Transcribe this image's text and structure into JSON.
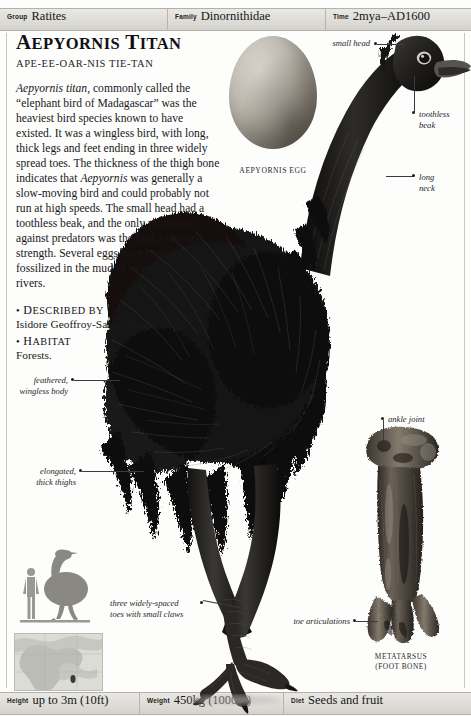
{
  "header": {
    "fields": [
      {
        "label": "Group",
        "value": "Ratites"
      },
      {
        "label": "Family",
        "value": "Dinornithidae"
      },
      {
        "label": "Time",
        "value": "2mya–AD1600"
      }
    ]
  },
  "footer": {
    "fields": [
      {
        "label": "Height",
        "value": "up to 3m (10ft)"
      },
      {
        "label": "Weight",
        "value": "450kg (1000lb)"
      },
      {
        "label": "Diet",
        "value": "Seeds and fruit"
      }
    ]
  },
  "article": {
    "title_first": "A",
    "title_rest": "EPYORNIS",
    "title_second_first": "T",
    "title_second_rest": "ITAN",
    "pronunciation": "APE-EE-OAR-NIS TIE-TAN",
    "paragraph_lead_italic": "Aepyornis titan",
    "paragraph_part1": ", commonly called the “elephant bird of Madagascar” was the heaviest bird species known to have existed. It was a wingless bird, with long, thick legs and feet ending in three widely spread toes. The thickness of the thigh bone indicates that ",
    "paragraph_italic2": "Aepyornis",
    "paragraph_part2": " was generally a slow-moving bird and could probably not run at high speeds. The small head had a toothless beak, and the only protection against predators was the bird’s size and strength. Several eggs have been found fossilized in the mud of swampy areas near rivers.",
    "sections": [
      {
        "bullet": "•",
        "head_first": "D",
        "head_rest": "ESCRIBED BY",
        "body": "Isidore Geoffroy-Saint-Hilaire; 1851."
      },
      {
        "bullet": "•",
        "head_first": "H",
        "head_rest": "ABITAT",
        "body": "Forests."
      }
    ]
  },
  "figures": {
    "egg_caption": "AEPYORNIS EGG",
    "bone_caption_line1": "METATARSUS",
    "bone_caption_line2": "(FOOT BONE)"
  },
  "annotations": [
    {
      "name": "small-head",
      "text": "small head"
    },
    {
      "name": "toothless-beak",
      "line1": "toothless",
      "line2": "beak"
    },
    {
      "name": "long-neck",
      "line1": "long",
      "line2": "neck"
    },
    {
      "name": "feathered-body",
      "line1": "feathered,",
      "line2": "wingless body"
    },
    {
      "name": "elongated-thighs",
      "line1": "elongated,",
      "line2": "thick thighs"
    },
    {
      "name": "three-toes",
      "line1": "three widely-spaced",
      "line2": "toes with small claws"
    },
    {
      "name": "ankle-joint",
      "text": "ankle joint"
    },
    {
      "name": "toe-articulations",
      "text": "toe articulations"
    }
  ],
  "colors": {
    "bar": "#dedcd6",
    "rule": "#b3b1aa",
    "ink": "#18181c",
    "bone": "#6c6459",
    "silhouette": "#8d8b86"
  }
}
